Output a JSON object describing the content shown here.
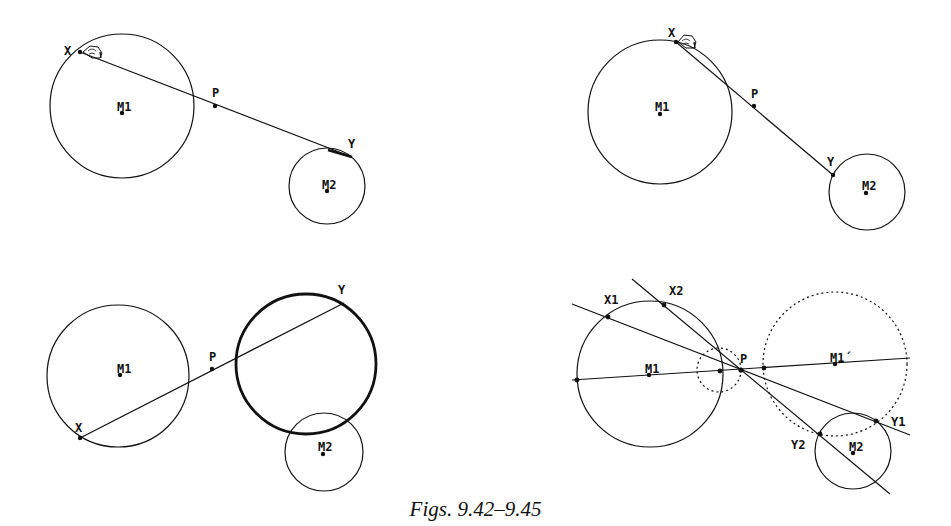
{
  "caption": "Figs. 9.42–9.45",
  "colors": {
    "stroke": "#111111",
    "background": "#ffffff"
  },
  "figures": [
    {
      "id": "fig-9-42",
      "labels": {
        "x": "X",
        "p": "P",
        "y": "Y",
        "m1": "M1",
        "m2": "M2"
      },
      "icons": [
        "hand-cursor-icon"
      ]
    },
    {
      "id": "fig-9-43",
      "labels": {
        "x": "X",
        "p": "P",
        "y": "Y",
        "m1": "M1",
        "m2": "M2"
      },
      "icons": [
        "hand-cursor-icon"
      ]
    },
    {
      "id": "fig-9-44",
      "labels": {
        "x": "X",
        "p": "P",
        "y": "Y",
        "m1": "M1",
        "m2": "M2"
      }
    },
    {
      "id": "fig-9-45",
      "labels": {
        "x1": "X1",
        "x2": "X2",
        "p": "P",
        "m1": "M1",
        "m1p": "M1´",
        "y1": "Y1",
        "y2": "Y2",
        "m2": "M2"
      }
    }
  ]
}
